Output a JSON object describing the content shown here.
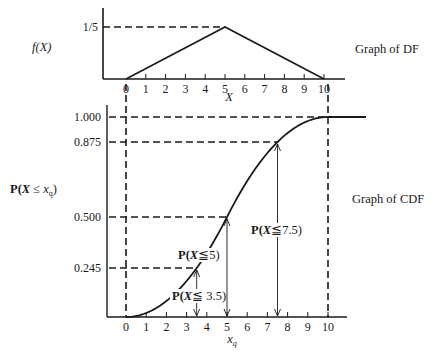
{
  "chart_data": [
    {
      "type": "line",
      "title": "Graph of DF",
      "ylabel": "f(X)",
      "xlabel": "X",
      "xlim": [
        0,
        10
      ],
      "ylim": [
        0,
        0.2
      ],
      "x_ticks": [
        "0",
        "1",
        "2",
        "3",
        "4",
        "5",
        "6",
        "7",
        "8",
        "9",
        "10"
      ],
      "y_ticks": [
        {
          "value": 0.2,
          "label": "1/5"
        }
      ],
      "series": [
        {
          "name": "density",
          "x": [
            0,
            5,
            10
          ],
          "y": [
            0,
            0.2,
            0
          ]
        }
      ],
      "guides": [
        {
          "type": "h",
          "y": 0.2,
          "x_to": 5
        }
      ],
      "grid": false
    },
    {
      "type": "line",
      "title": "Graph of CDF",
      "ylabel_parts": {
        "p": "P(",
        "x": "X",
        "le": " ≤ ",
        "xq": "x",
        "sub": "q",
        "close": ")"
      },
      "xlabel": {
        "base": "x",
        "sub": "q"
      },
      "xlim": [
        0,
        10
      ],
      "ylim": [
        0,
        1
      ],
      "x_ticks": [
        "0",
        "1",
        "2",
        "3",
        "4",
        "5",
        "6",
        "7",
        "8",
        "9",
        "10"
      ],
      "y_ticks": [
        {
          "value": 1.0,
          "label": "1.000"
        },
        {
          "value": 0.875,
          "label": "0.875"
        },
        {
          "value": 0.5,
          "label": "0.500"
        },
        {
          "value": 0.245,
          "label": "0.245"
        }
      ],
      "series": [
        {
          "name": "cdf",
          "function": "triangular(0,5,10)",
          "plateau_after": 10,
          "plateau_value": 1.0
        }
      ],
      "annotations": [
        {
          "x": 3.5,
          "y": 0.245,
          "label": {
            "p": "P(",
            "x": "X",
            "rest": "≦ 3.5)"
          }
        },
        {
          "x": 5,
          "y": 0.5,
          "label": {
            "p": "P(",
            "x": "X",
            "rest": "≦5)"
          }
        },
        {
          "x": 7.5,
          "y": 0.875,
          "label": {
            "p": "P(",
            "x": "X",
            "rest": "≦7.5)"
          }
        }
      ],
      "grid": false
    }
  ],
  "labels": {
    "df_title": "Graph of DF",
    "cdf_title": "Graph of CDF",
    "fx": "f(X)",
    "X": "X"
  }
}
